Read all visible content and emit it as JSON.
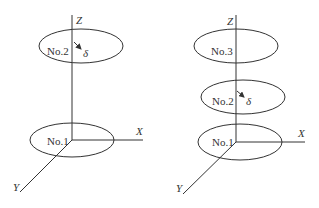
{
  "diagrams": [
    {
      "name": "two-disk-configuration",
      "axes": {
        "z": "Z",
        "x": "X",
        "y": "Y"
      },
      "disks": [
        {
          "label": "No.2",
          "role": "upper"
        },
        {
          "label": "No.1",
          "role": "base"
        }
      ],
      "offset_symbol": "δ"
    },
    {
      "name": "three-disk-configuration",
      "axes": {
        "z": "Z",
        "x": "X",
        "y": "Y"
      },
      "disks": [
        {
          "label": "No.3",
          "role": "top"
        },
        {
          "label": "No.2",
          "role": "middle"
        },
        {
          "label": "No.1",
          "role": "base"
        }
      ],
      "offset_symbol": "δ"
    }
  ],
  "colors": {
    "stroke": "#333333",
    "background": "#ffffff"
  }
}
